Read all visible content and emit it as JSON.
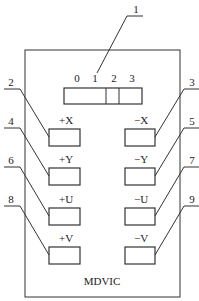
{
  "diagram": {
    "title": "MDVIC",
    "display": {
      "digits": [
        "0",
        "1",
        "2",
        "3"
      ]
    },
    "callouts": [
      "1",
      "2",
      "3",
      "4",
      "5",
      "6",
      "7",
      "8",
      "9"
    ],
    "buttons": {
      "left": [
        {
          "label": "+X",
          "callout": "2"
        },
        {
          "label": "+Y",
          "callout": "4"
        },
        {
          "label": "+U",
          "callout": "6"
        },
        {
          "label": "+V",
          "callout": "8"
        }
      ],
      "right": [
        {
          "label": "−X",
          "callout": "3"
        },
        {
          "label": "−Y",
          "callout": "5"
        },
        {
          "label": "−U",
          "callout": "7"
        },
        {
          "label": "−V",
          "callout": "9"
        }
      ]
    },
    "colors": {
      "line": "#333333",
      "background": "#ffffff"
    }
  }
}
